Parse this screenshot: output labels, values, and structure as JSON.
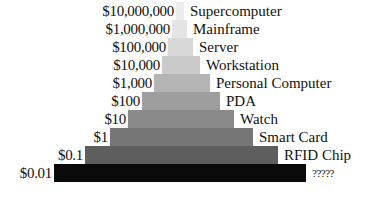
{
  "chart_data": {
    "type": "bar",
    "orientation": "horizontal-pyramid",
    "title": "",
    "xlabel": "",
    "ylabel": "",
    "grid": false,
    "legend": false,
    "scale": "log10",
    "categories": [
      "Supercomputer",
      "Mainframe",
      "Server",
      "Workstation",
      "Personal Computer",
      "PDA",
      "Watch",
      "Smart Card",
      "RFID Chip",
      "?????"
    ],
    "price_labels": [
      "$10,000,000",
      "$1,000,000",
      "$100,000",
      "$10,000",
      "$1,000",
      "$100",
      "$10",
      "$1",
      "$0.1",
      "$0.01"
    ],
    "values": [
      10000000,
      1000000,
      100000,
      10000,
      1000,
      100,
      10,
      1,
      0.1,
      0.01
    ],
    "volume_rank": [
      1,
      2,
      3,
      4,
      5,
      6,
      7,
      8,
      9,
      10
    ],
    "bars": [
      {
        "label": "Supercomputer",
        "price": "$10,000,000",
        "left": 176,
        "width": 8,
        "top": 2,
        "color": "#ececec"
      },
      {
        "label": "Mainframe",
        "price": "$1,000,000",
        "left": 172,
        "width": 15,
        "top": 20,
        "color": "#e4e4e4"
      },
      {
        "label": "Server",
        "price": "$100,000",
        "left": 168,
        "width": 25,
        "top": 38,
        "color": "#d8d8d8"
      },
      {
        "label": "Workstation",
        "price": "$10,000",
        "left": 162,
        "width": 38,
        "top": 56,
        "color": "#cacaca"
      },
      {
        "label": "Personal Computer",
        "price": "$1,000",
        "left": 154,
        "width": 56,
        "top": 74,
        "color": "#b4b4b4"
      },
      {
        "label": "PDA",
        "price": "$100",
        "left": 142,
        "width": 78,
        "top": 92,
        "color": "#9e9e9e"
      },
      {
        "label": "Watch",
        "price": "$10",
        "left": 128,
        "width": 106,
        "top": 110,
        "color": "#8a8a8a"
      },
      {
        "label": "Smart Card",
        "price": "$1",
        "left": 110,
        "width": 143,
        "top": 128,
        "color": "#767676"
      },
      {
        "label": "RFID Chip",
        "price": "$0.1",
        "left": 85,
        "width": 193,
        "top": 146,
        "color": "#5e5e5e"
      },
      {
        "label": "?????",
        "price": "$0.01",
        "left": 54,
        "width": 252,
        "top": 164,
        "color": "#0a0a0a"
      }
    ]
  }
}
